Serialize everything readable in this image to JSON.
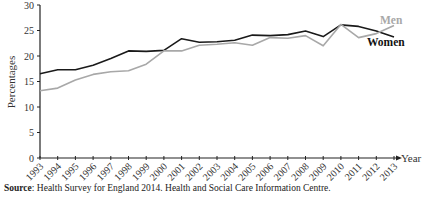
{
  "chart_data": {
    "type": "line",
    "title": "",
    "xlabel": "Year",
    "ylabel": "Percentages",
    "ylim": [
      0,
      30
    ],
    "yticks": [
      0,
      5,
      10,
      15,
      20,
      25,
      30
    ],
    "grid": false,
    "legend_position": "inline-right",
    "x": [
      1993,
      1994,
      1995,
      1996,
      1997,
      1998,
      1999,
      2000,
      2001,
      2002,
      2003,
      2004,
      2005,
      2006,
      2007,
      2008,
      2009,
      2010,
      2011,
      2012,
      2013
    ],
    "series": [
      {
        "name": "Women",
        "color": "#1a1a1a",
        "values": [
          16.5,
          17.3,
          17.3,
          18.2,
          19.5,
          21.0,
          20.9,
          21.1,
          23.4,
          22.7,
          22.8,
          23.1,
          24.1,
          24.0,
          24.2,
          24.9,
          23.8,
          26.1,
          25.8,
          24.9,
          23.7
        ]
      },
      {
        "name": "Men",
        "color": "#a8a8a8",
        "values": [
          13.2,
          13.7,
          15.3,
          16.4,
          16.9,
          17.1,
          18.4,
          21.0,
          21.0,
          22.1,
          22.3,
          22.6,
          22.1,
          23.6,
          23.5,
          24.0,
          22.0,
          26.2,
          23.6,
          24.4,
          26.0
        ]
      }
    ]
  },
  "labels": {
    "men": "Men",
    "women": "Women",
    "year": "Year",
    "ylabel": "Percentages"
  },
  "source": {
    "label": "Source",
    "text": ": Health Survey for England 2014.  Health and Social Care Information Centre."
  }
}
